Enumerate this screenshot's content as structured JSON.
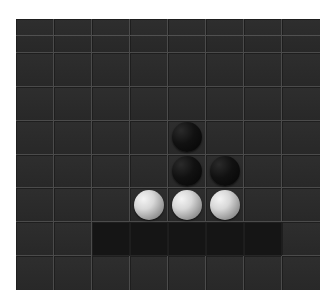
{
  "game": {
    "type": "othello-board",
    "rows": 8,
    "cols": 8,
    "colors": {
      "board": "#2b2b2b",
      "grid_line": "#4b4b4b",
      "highlight_band": "#151515",
      "black_stone": "#0a0a0a",
      "white_stone": "#e0e0e0"
    },
    "stones": [
      {
        "row": 3,
        "col": 4,
        "color": "black"
      },
      {
        "row": 4,
        "col": 4,
        "color": "black"
      },
      {
        "row": 4,
        "col": 5,
        "color": "black"
      },
      {
        "row": 5,
        "col": 3,
        "color": "white"
      },
      {
        "row": 5,
        "col": 4,
        "color": "white"
      },
      {
        "row": 5,
        "col": 5,
        "color": "white"
      }
    ],
    "shaded_cells": [
      {
        "row": 6,
        "col": 2
      },
      {
        "row": 6,
        "col": 3
      },
      {
        "row": 6,
        "col": 4
      },
      {
        "row": 6,
        "col": 5
      },
      {
        "row": 6,
        "col": 6
      }
    ]
  }
}
